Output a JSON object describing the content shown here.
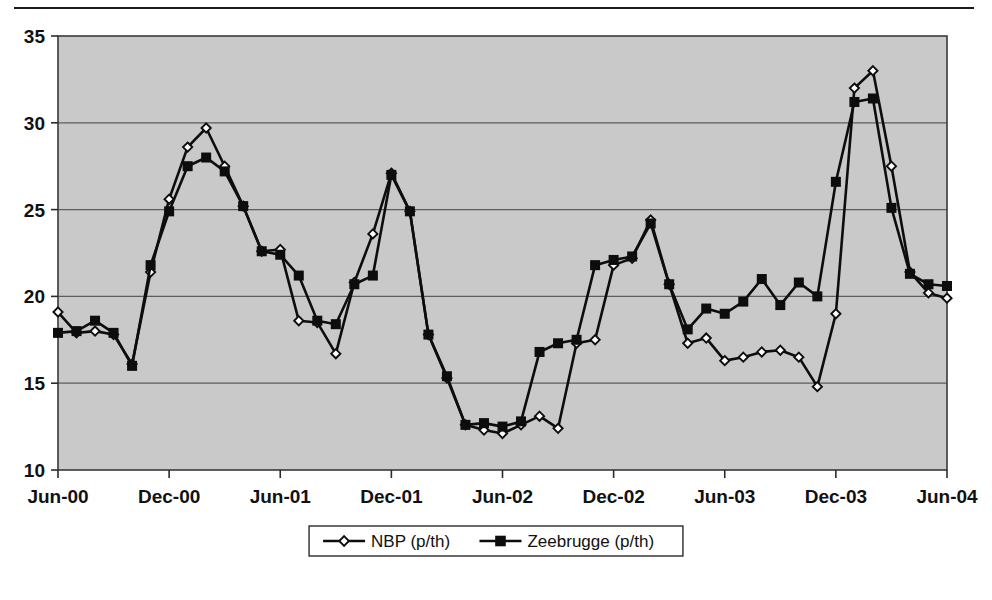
{
  "chart_data": {
    "type": "line",
    "title": "",
    "xlabel": "",
    "ylabel": "",
    "ylim": [
      10,
      35
    ],
    "ytick_labels": [
      "10",
      "15",
      "20",
      "25",
      "30",
      "35"
    ],
    "ytick_values": [
      10,
      15,
      20,
      25,
      30,
      35
    ],
    "grid": true,
    "legend_position": "bottom-center",
    "x": [
      "Jun-00",
      "Jul-00",
      "Aug-00",
      "Sep-00",
      "Oct-00",
      "Nov-00",
      "Dec-00",
      "Jan-01",
      "Feb-01",
      "Mar-01",
      "Apr-01",
      "May-01",
      "Jun-01",
      "Jul-01",
      "Aug-01",
      "Sep-01",
      "Oct-01",
      "Nov-01",
      "Dec-01",
      "Jan-02",
      "Feb-02",
      "Mar-02",
      "Apr-02",
      "May-02",
      "Jun-02",
      "Jul-02",
      "Aug-02",
      "Sep-02",
      "Oct-02",
      "Nov-02",
      "Dec-02",
      "Jan-03",
      "Feb-03",
      "Mar-03",
      "Apr-03",
      "May-03",
      "Jun-03",
      "Jul-03",
      "Aug-03",
      "Sep-03",
      "Oct-03",
      "Nov-03",
      "Dec-03",
      "Jan-04",
      "Feb-04",
      "Mar-04",
      "Apr-04",
      "May-04",
      "Jun-04"
    ],
    "xtick_labels": [
      "Jun-00",
      "Dec-00",
      "Jun-01",
      "Dec-01",
      "Jun-02",
      "Dec-02",
      "Jun-03",
      "Dec-03",
      "Jun-04"
    ],
    "xtick_indices": [
      0,
      6,
      12,
      18,
      24,
      30,
      36,
      42,
      48
    ],
    "series": [
      {
        "name": "NBP (p/th)",
        "marker": "open-diamond",
        "values": [
          19.1,
          17.9,
          18.0,
          17.8,
          16.1,
          21.4,
          25.6,
          28.6,
          29.7,
          27.5,
          25.2,
          22.6,
          22.7,
          18.6,
          18.5,
          16.7,
          20.8,
          23.6,
          27.1,
          24.9,
          17.8,
          15.3,
          12.6,
          12.3,
          12.1,
          12.6,
          13.1,
          12.4,
          17.3,
          17.5,
          21.8,
          22.2,
          24.4,
          20.7,
          17.3,
          17.6,
          16.3,
          16.5,
          16.8,
          16.9,
          16.5,
          14.8,
          19.0,
          32.0,
          33.0,
          27.5,
          21.4,
          20.2,
          19.9
        ]
      },
      {
        "name": "Zeebrugge (p/th)",
        "marker": "filled-square",
        "values": [
          17.9,
          18.0,
          18.6,
          17.9,
          16.0,
          21.8,
          24.9,
          27.5,
          28.0,
          27.2,
          25.2,
          22.6,
          22.4,
          21.2,
          18.6,
          18.4,
          20.7,
          21.2,
          27.0,
          24.9,
          17.8,
          15.4,
          12.6,
          12.7,
          12.5,
          12.8,
          16.8,
          17.3,
          17.5,
          21.8,
          22.1,
          22.3,
          24.2,
          20.7,
          18.1,
          19.3,
          19.0,
          19.7,
          21.0,
          19.5,
          20.8,
          20.0,
          26.6,
          31.2,
          31.4,
          25.1,
          21.3,
          20.7,
          20.6
        ]
      }
    ]
  },
  "legend": {
    "entries": [
      {
        "label": "NBP (p/th)"
      },
      {
        "label": "Zeebrugge (p/th)"
      }
    ]
  }
}
